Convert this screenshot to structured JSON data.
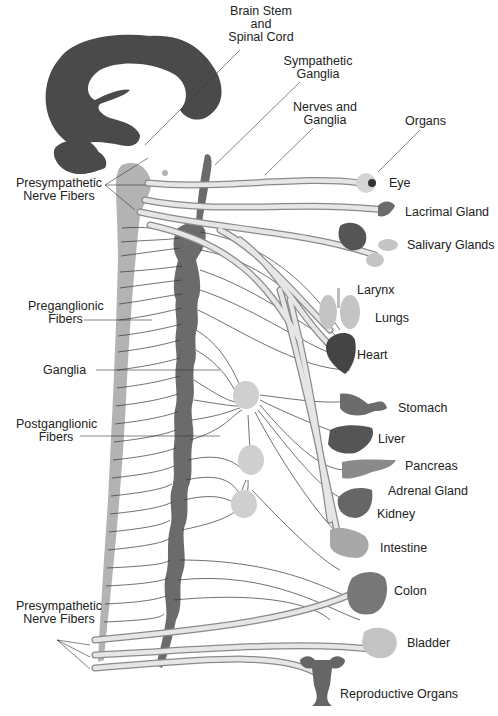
{
  "colors": {
    "brain": "#4a4a4a",
    "spinal_cord": "#b3b3b3",
    "sympathetic_chain": "#6b6b6b",
    "nerve_fill": "#e2e2e2",
    "nerve_stroke": "#8a8a8a",
    "ganglion": "#cfcfcf",
    "organ_dark": "#555555",
    "organ_mid": "#8a8a8a",
    "organ_light": "#c4c4c4",
    "leader_line": "#333333"
  },
  "structure_labels": {
    "brain_stem": [
      "Brain Stem",
      "and",
      "Spinal Cord"
    ],
    "sympathetic_ganglia": [
      "Sympathetic",
      "Ganglia"
    ],
    "nerves_ganglia": [
      "Nerves and",
      "Ganglia"
    ],
    "organs": "Organs",
    "presympathetic_top": [
      "Presympathetic",
      "Nerve Fibers"
    ],
    "preganglionic": [
      "Preganglionic",
      "Fibers"
    ],
    "ganglia": "Ganglia",
    "postganglionic": [
      "Postganglionic",
      "Fibers"
    ],
    "presympathetic_bottom": [
      "Presympathetic",
      "Nerve Fibers"
    ]
  },
  "organs": [
    {
      "label": "Eye"
    },
    {
      "label": "Lacrimal Gland"
    },
    {
      "label": "Salivary Glands"
    },
    {
      "label": "Larynx"
    },
    {
      "label": "Lungs"
    },
    {
      "label": "Heart"
    },
    {
      "label": "Stomach"
    },
    {
      "label": "Liver"
    },
    {
      "label": "Pancreas"
    },
    {
      "label": "Adrenal Gland"
    },
    {
      "label": "Kidney"
    },
    {
      "label": "Intestine"
    },
    {
      "label": "Colon"
    },
    {
      "label": "Bladder"
    },
    {
      "label": "Reproductive Organs"
    }
  ]
}
